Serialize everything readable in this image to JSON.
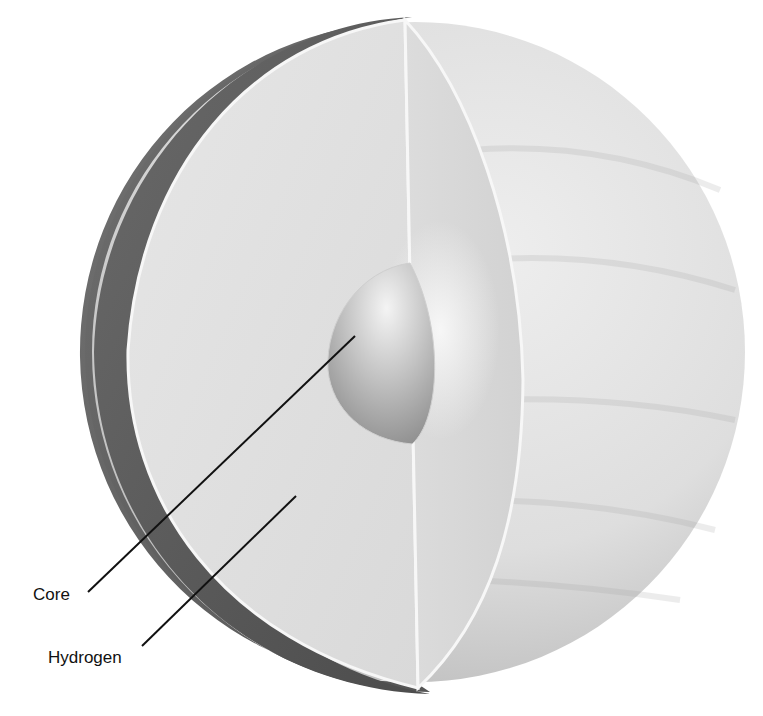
{
  "diagram": {
    "labels": [
      {
        "id": "core",
        "text": "Core",
        "x": 33,
        "y": 586,
        "line": [
          [
            88,
            592
          ],
          [
            355,
            336
          ]
        ]
      },
      {
        "id": "hydrogen",
        "text": "Hydrogen",
        "x": 48,
        "y": 649,
        "line": [
          [
            142,
            646
          ],
          [
            296,
            496
          ]
        ]
      }
    ]
  },
  "colors": {
    "background": "#ffffff",
    "outer_surface_light": "#e9e9e9",
    "outer_surface_shadow": "#bdbdbd",
    "rim_shadow": "#5e5e5e",
    "cut_face": "#e3e3e3",
    "cut_edge_highlight": "#f6f6f6",
    "core_light": "#f1f1f1",
    "core_dark": "#8e8e8e",
    "leader_line": "#111111"
  }
}
